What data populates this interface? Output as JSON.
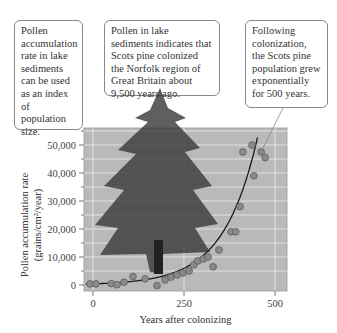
{
  "callouts": [
    {
      "text": "Pollen accumulation rate in lake sediments can be used as an index of population size."
    },
    {
      "text": "Pollen in lake sediments indicates that Scots pine colonized the Norfolk region of Great Britain about 9,500 years ago."
    },
    {
      "text": "Following colonization, the Scots pine population grew exponentially for 500 years."
    }
  ],
  "axes": {
    "ylabel_line1": "Pollen accumulation rate",
    "ylabel_line2": "(grains/cm²/year)",
    "xlabel": "Years after colonizing"
  },
  "colors": {
    "plot_bg": "#b9b9b9",
    "grid": "#e6e6e6",
    "point_fill": "#8a8a8a",
    "curve": "#1a1a1a",
    "tree": "#3c3c3c"
  },
  "chart_data": {
    "type": "scatter",
    "title": "",
    "xlabel": "Years after colonizing",
    "ylabel": "Pollen accumulation rate (grains/cm²/year)",
    "xlim": [
      0,
      530
    ],
    "ylim": [
      0,
      56000
    ],
    "xticks": [
      0,
      250,
      500
    ],
    "xtick_labels": [
      "0",
      "250",
      "500"
    ],
    "yticks": [
      0,
      10000,
      20000,
      30000,
      40000,
      50000
    ],
    "ytick_labels": [
      "0",
      "10,000",
      "20,000",
      "30,000",
      "40,000",
      "50,000"
    ],
    "grid": true,
    "series": [
      {
        "name": "Observed pollen accumulation",
        "type": "scatter",
        "x": [
          -8,
          8,
          50,
          66,
          85,
          110,
          143,
          176,
          198,
          214,
          231,
          247,
          264,
          277,
          288,
          303,
          316,
          330,
          346,
          379,
          392,
          404,
          412,
          437,
          442,
          462,
          473
        ],
        "y": [
          400,
          400,
          500,
          100,
          1000,
          3000,
          2200,
          -200,
          1800,
          2800,
          3600,
          4300,
          5000,
          7200,
          8600,
          9300,
          10000,
          6500,
          12500,
          19000,
          19000,
          28000,
          47500,
          50000,
          39000,
          47500,
          45500
        ]
      },
      {
        "name": "Exponential fit",
        "type": "line",
        "x": [
          0,
          50,
          100,
          150,
          200,
          250,
          300,
          350,
          400,
          425,
          450
        ],
        "y": [
          400,
          550,
          800,
          1200,
          1900,
          3200,
          5600,
          10000,
          20000,
          30000,
          55000
        ]
      }
    ],
    "annotations": [
      "Pollen accumulation rate in lake sediments can be used as an index of population size.",
      "Pollen in lake sediments indicates that Scots pine colonized the Norfolk region of Great Britain about 9,500 years ago.",
      "Following colonization, the Scots pine population grew exponentially for 500 years."
    ]
  }
}
